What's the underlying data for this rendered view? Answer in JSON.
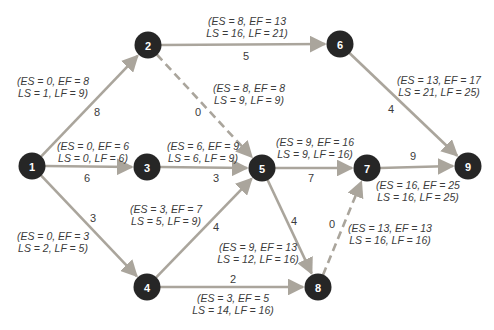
{
  "diagram": {
    "type": "activity-network",
    "colors": {
      "edge": "#aaa59c",
      "node_fill": "#262626",
      "node_text": "#ffffff",
      "label_text": "#3b3b3b",
      "background": "#ffffff"
    },
    "nodes": [
      {
        "id": "1"
      },
      {
        "id": "2"
      },
      {
        "id": "3"
      },
      {
        "id": "4"
      },
      {
        "id": "5"
      },
      {
        "id": "6"
      },
      {
        "id": "7"
      },
      {
        "id": "8"
      },
      {
        "id": "9"
      }
    ],
    "edges": [
      {
        "from": "1",
        "to": "2",
        "type": "solid",
        "duration": "8",
        "label_line1": "(ES = 0, EF = 8",
        "label_line2": "LS = 1, LF = 9)"
      },
      {
        "from": "1",
        "to": "3",
        "type": "solid",
        "duration": "6",
        "label_line1": "(ES = 0, EF = 6",
        "label_line2": "LS = 0, LF = 6)"
      },
      {
        "from": "1",
        "to": "4",
        "type": "solid",
        "duration": "3",
        "label_line1": "(ES = 0, EF = 3",
        "label_line2": "LS = 2, LF = 5)"
      },
      {
        "from": "2",
        "to": "6",
        "type": "solid",
        "duration": "5",
        "label_line1": "(ES = 8, EF = 13",
        "label_line2": "LS = 16, LF = 21)"
      },
      {
        "from": "2",
        "to": "5",
        "type": "dashed",
        "duration": "0",
        "label_line1": "(ES = 8, EF = 8",
        "label_line2": "LS = 9, LF = 9)"
      },
      {
        "from": "3",
        "to": "5",
        "type": "solid",
        "duration": "3",
        "label_line1": "(ES = 6, EF = 9",
        "label_line2": "LS = 6, LF = 9)"
      },
      {
        "from": "4",
        "to": "5",
        "type": "solid",
        "duration": "4",
        "label_line1": "(ES = 3, EF = 7",
        "label_line2": "LS = 5, LF = 9)"
      },
      {
        "from": "4",
        "to": "8",
        "type": "solid",
        "duration": "2",
        "label_line1": "(ES = 3, EF = 5",
        "label_line2": "LS = 14, LF = 16)"
      },
      {
        "from": "5",
        "to": "7",
        "type": "solid",
        "duration": "7",
        "label_line1": "(ES = 9, EF = 16",
        "label_line2": "LS = 9, LF = 16)"
      },
      {
        "from": "5",
        "to": "8",
        "type": "solid",
        "duration": "4",
        "label_line1": "(ES = 9, EF = 13",
        "label_line2": "LS = 12, LF = 16)"
      },
      {
        "from": "6",
        "to": "9",
        "type": "solid",
        "duration": "4",
        "label_line1": "(ES = 13, EF = 17",
        "label_line2": "LS = 21, LF = 25)"
      },
      {
        "from": "7",
        "to": "9",
        "type": "solid",
        "duration": "9",
        "label_line1": "(ES = 16, EF = 25",
        "label_line2": "LS = 16, LF = 25)"
      },
      {
        "from": "8",
        "to": "7",
        "type": "dashed",
        "duration": "0",
        "label_line1": "(ES = 13, EF = 13",
        "label_line2": "LS = 16, LF = 16)"
      }
    ]
  }
}
